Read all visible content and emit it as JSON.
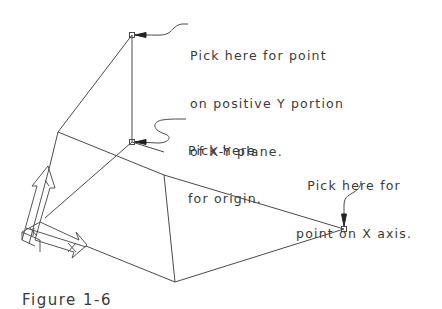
{
  "figure": {
    "caption": "Figure 1-6",
    "line_color": "#4a4a4a",
    "text_color": "#3a3a3a",
    "background": "#ffffff"
  },
  "callouts": {
    "positive_y": {
      "lines": [
        "Pick here for point",
        "on positive Y portion",
        "of X-Y plane."
      ]
    },
    "origin": {
      "lines": [
        "Pick here",
        "for origin."
      ]
    },
    "x_axis": {
      "lines": [
        "Pick here for",
        "point on X axis."
      ]
    }
  },
  "pick_points": [
    {
      "name": "positive-y-point",
      "x": 132,
      "y": 35
    },
    {
      "name": "origin-point",
      "x": 132,
      "y": 142
    },
    {
      "name": "x-axis-point",
      "x": 344,
      "y": 229
    }
  ],
  "ucs_icon": {
    "description": "UCS icon with X and Y arrows"
  }
}
